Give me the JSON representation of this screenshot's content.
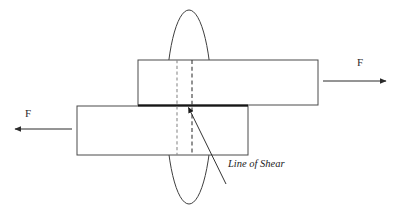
{
  "figure": {
    "type": "engineering-diagram",
    "background_color": "#ffffff"
  },
  "labels": {
    "force_right": "F",
    "force_left": "F",
    "line_of_shear": "Line of Shear"
  },
  "colors": {
    "outline": "#4a4a4a",
    "outline_dark": "#2e2e2e",
    "shear_line": "#161616",
    "dashed_left": "#8c8c8c",
    "dashed_right": "#3a3a3a",
    "ellipse": "#3f3f3f",
    "arrow": "#2b2b2b",
    "leader": "#2b2b2b",
    "text": "#1c1c1c"
  },
  "geometry": {
    "canvas": {
      "width": 403,
      "height": 217
    },
    "upper_plate": {
      "x": 138,
      "y": 60,
      "width": 180,
      "height": 45
    },
    "lower_plate": {
      "x": 77,
      "y": 106,
      "width": 171,
      "height": 49
    },
    "shear_line": {
      "x1": 138,
      "y1": 105.5,
      "x2": 248,
      "y2": 105.5,
      "stroke_width": 1.8
    },
    "highlight_ellipse": {
      "cx": 189,
      "cy": 107,
      "rx": 23,
      "ry": 97
    },
    "dashed_line_left": {
      "x": 177,
      "y1": 60,
      "y2": 155
    },
    "dashed_line_right": {
      "x": 192,
      "y1": 60,
      "y2": 155
    },
    "arrow_right": {
      "x1": 323,
      "y1": 81,
      "x2": 388,
      "y2": 81
    },
    "arrow_left": {
      "x1": 72,
      "y1": 129,
      "x2": 13,
      "y2": 129
    },
    "leader_line": {
      "x1": 187,
      "y1": 107,
      "x2": 226,
      "y2": 184
    },
    "force_right_label_pos": {
      "x": 360,
      "y": 66
    },
    "force_left_label_pos": {
      "x": 28,
      "y": 117
    },
    "shear_label_pos": {
      "x": 228,
      "y": 167
    }
  }
}
